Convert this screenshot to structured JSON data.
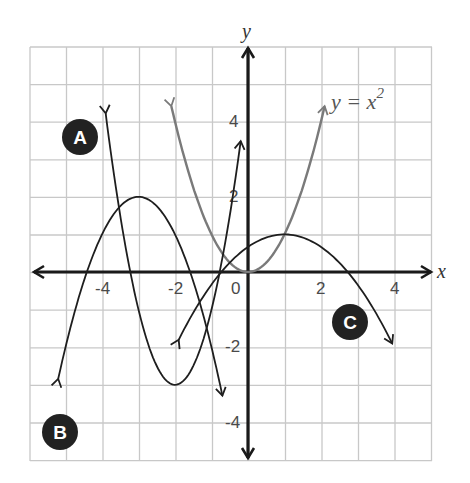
{
  "chart_data": {
    "type": "line",
    "title": "",
    "xlabel": "x",
    "ylabel": "y",
    "xlim": [
      -5.5,
      5.5
    ],
    "ylim": [
      -5,
      6
    ],
    "grid": true,
    "x_ticks": [
      "-4",
      "-2",
      "0",
      "2",
      "4"
    ],
    "y_ticks": [
      "4",
      "2",
      "-2",
      "-4"
    ],
    "series": [
      {
        "name": "y = x^2",
        "label": "y = x",
        "label_exp": "2",
        "color": "#7a7a7a",
        "equation": "y = x^2",
        "x_range": [
          -2.1,
          2.1
        ],
        "vertex": [
          0,
          0
        ]
      },
      {
        "name": "A",
        "color": "#1e1e1e",
        "equation": "y = 2(x + 2)^2 - 3",
        "x_range": [
          -3.9,
          -0.2
        ],
        "vertex": [
          -2,
          -3
        ]
      },
      {
        "name": "B",
        "color": "#1e1e1e",
        "equation": "y = -(x + 3)^2 + 2",
        "x_range": [
          -5.2,
          -0.7
        ],
        "vertex": [
          -3,
          2
        ]
      },
      {
        "name": "C",
        "color": "#1e1e1e",
        "equation": "y = -(1/3)(x - 1)^2 + 1",
        "x_range": [
          -1.9,
          3.95
        ],
        "vertex": [
          1,
          1
        ]
      }
    ],
    "annotations": [
      "A",
      "B",
      "C",
      "y = x^2"
    ]
  },
  "labels": {
    "x_axis": "x",
    "y_axis": "y",
    "origin": "0",
    "eq_main": "y = x",
    "eq_exp": "2",
    "badge_a": "A",
    "badge_b": "B",
    "badge_c": "C",
    "tick_x_m4": "-4",
    "tick_x_m2": "-2",
    "tick_x_2": "2",
    "tick_x_4": "4",
    "tick_y_4": "4",
    "tick_y_2": "2",
    "tick_y_m2": "-2",
    "tick_y_m4": "-4"
  },
  "colors": {
    "grid": "#c8c8c8",
    "axis": "#1a1a1a",
    "curve": "#1e1e1e",
    "parent_curve": "#7a7a7a",
    "badge": "#222222"
  }
}
